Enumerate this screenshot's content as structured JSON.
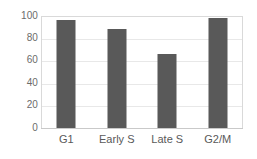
{
  "chart_data": {
    "type": "bar",
    "title": "",
    "xlabel": "",
    "ylabel": "",
    "categories": [
      "G1",
      "Early S",
      "Late S",
      "G2/M"
    ],
    "values": [
      96,
      88,
      66,
      98
    ],
    "ylim": [
      0,
      100
    ],
    "yticks": [
      0,
      20,
      40,
      60,
      80,
      100
    ],
    "ytick_labels": [
      "0",
      "20",
      "40",
      "60",
      "80",
      "100"
    ],
    "grid": true,
    "grid_axis": "y",
    "legend": false,
    "legend_position": "none",
    "series": [
      {
        "name": "",
        "values": [
          96,
          88,
          66,
          98
        ]
      }
    ]
  },
  "style": {
    "bar_color": "#595959",
    "gridline_color": "#e8e8e8",
    "axis_color": "#c9c9c9",
    "plot_border_color": "#d9d9d9",
    "tick_label_color": "#6b6b6b",
    "category_label_color": "#595959",
    "background": "#ffffff"
  }
}
